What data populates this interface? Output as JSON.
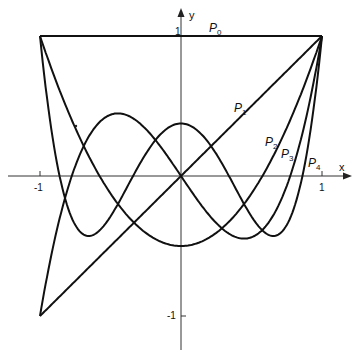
{
  "chart_data": {
    "type": "line",
    "title": "",
    "xlabel": "x",
    "ylabel": "y",
    "xlim": [
      -1,
      1
    ],
    "ylim": [
      -1,
      1
    ],
    "grid": false,
    "x_ticks": [
      "-1",
      "1"
    ],
    "y_ticks": [
      "1",
      "-1"
    ],
    "series": [
      {
        "name": "P0",
        "formula": "1"
      },
      {
        "name": "P1",
        "formula": "x"
      },
      {
        "name": "P2",
        "formula": "(3x^2-1)/2"
      },
      {
        "name": "P3",
        "formula": "(5x^3-3x)/2"
      },
      {
        "name": "P4",
        "formula": "(35x^4-30x^2+3)/8"
      }
    ],
    "legend": "inline labels"
  },
  "labels": {
    "x_axis": "x",
    "y_axis": "y",
    "x_tick_neg": "-1",
    "x_tick_pos": "1",
    "y_tick_pos": "1",
    "y_tick_neg": "-1",
    "P0": "P",
    "P0_sub": "0",
    "P1": "P",
    "P1_sub": "1",
    "P2": "P",
    "P2_sub": "2",
    "P3": "P",
    "P3_sub": "3",
    "P4": "P",
    "P4_sub": "4"
  }
}
